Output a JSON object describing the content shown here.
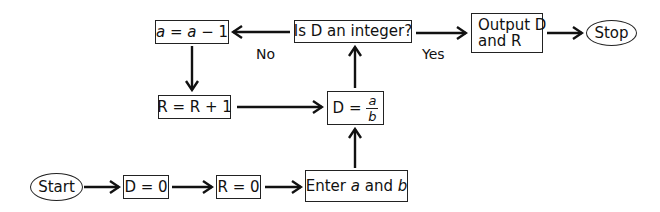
{
  "diagram": {
    "type": "flowchart",
    "nodes": {
      "start": {
        "label": "Start",
        "shape": "oval"
      },
      "d_zero": {
        "label": "D = 0",
        "shape": "rect"
      },
      "r_zero": {
        "label": "R = 0",
        "shape": "rect"
      },
      "enter": {
        "prefix": "Enter ",
        "var_a": "a",
        "mid": " and ",
        "var_b": "b",
        "shape": "rect"
      },
      "divide": {
        "prefix": "D =",
        "numerator": "a",
        "denominator": "b",
        "shape": "rect"
      },
      "decision": {
        "label": "Is D an integer?",
        "shape": "rect"
      },
      "decrement": {
        "var1": "a",
        "mid": " = ",
        "var2": "a",
        "suffix": " − 1",
        "shape": "rect"
      },
      "increment": {
        "label": "R = R + 1",
        "shape": "rect"
      },
      "output": {
        "line1": "Output D",
        "line2": "and R",
        "shape": "rect"
      },
      "stop": {
        "label": "Stop",
        "shape": "oval"
      }
    },
    "edge_labels": {
      "no": "No",
      "yes": "Yes"
    },
    "edges": [
      {
        "from": "start",
        "to": "d_zero"
      },
      {
        "from": "d_zero",
        "to": "r_zero"
      },
      {
        "from": "r_zero",
        "to": "enter"
      },
      {
        "from": "enter",
        "to": "divide"
      },
      {
        "from": "divide",
        "to": "decision"
      },
      {
        "from": "decision",
        "to": "output",
        "label": "Yes"
      },
      {
        "from": "decision",
        "to": "decrement",
        "label": "No"
      },
      {
        "from": "decrement",
        "to": "increment"
      },
      {
        "from": "increment",
        "to": "divide"
      },
      {
        "from": "output",
        "to": "stop"
      }
    ]
  }
}
